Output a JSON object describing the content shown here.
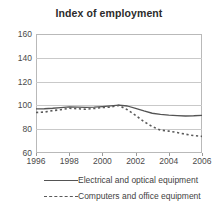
{
  "chart_data": {
    "type": "line",
    "title": "Index of employment",
    "xlabel": "",
    "ylabel": "",
    "xlim": [
      1996,
      2006
    ],
    "ylim": [
      60,
      160
    ],
    "yticks": [
      60,
      80,
      100,
      120,
      140,
      160
    ],
    "xticks": [
      1996,
      1998,
      2000,
      2002,
      2004,
      2006
    ],
    "grid": true,
    "legend_position": "bottom",
    "x": [
      1996,
      1996.5,
      1997,
      1997.5,
      1998,
      1998.5,
      1999,
      1999.5,
      2000,
      2000.5,
      2001,
      2001.5,
      2002,
      2002.5,
      2003,
      2003.5,
      2004,
      2004.5,
      2005,
      2005.5,
      2006
    ],
    "series": [
      {
        "name": "Electrical and optical equipment",
        "style": "solid",
        "color": "#545454",
        "values": [
          97.0,
          97.2,
          97.6,
          98.2,
          98.7,
          98.6,
          98.3,
          98.5,
          99.0,
          99.6,
          100.2,
          99.5,
          97.5,
          95.3,
          93.4,
          92.4,
          91.8,
          91.4,
          91.1,
          91.3,
          91.7
        ]
      },
      {
        "name": "Computers and office equipment",
        "style": "dashed",
        "color": "#5a5a5a",
        "values": [
          94.0,
          94.4,
          95.6,
          96.4,
          97.6,
          97.2,
          96.8,
          97.4,
          98.2,
          98.6,
          100.0,
          96.4,
          91.6,
          86.4,
          82.2,
          79.2,
          78.4,
          77.2,
          75.8,
          74.6,
          74.0
        ]
      }
    ]
  },
  "legend": {
    "items": [
      {
        "label": "Electrical and optical equipment",
        "style": "solid"
      },
      {
        "label": "Computers and office equipment",
        "style": "dashed"
      }
    ]
  }
}
